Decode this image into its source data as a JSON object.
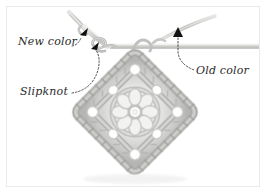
{
  "figure": {
    "kind": "instructional-photo",
    "frame_border_color": "#e9e9e9",
    "background_color": "#ffffff"
  },
  "annotations": {
    "arrow_color": "#111111",
    "leader_color": "#3a3a3a",
    "text_color": "#2b2b2b",
    "labels": [
      {
        "id": "new-color",
        "text": "New color",
        "x": 18,
        "y": 35,
        "arrow_x": 85,
        "arrow_y": 31
      },
      {
        "id": "slipknot",
        "text": "Slipknot",
        "x": 20,
        "y": 85,
        "arrow_x": 96,
        "arrow_y": 45
      },
      {
        "id": "old-color",
        "text": "Old color",
        "x": 196,
        "y": 64,
        "arrow_x": 178,
        "arrow_y": 31
      }
    ]
  },
  "photo": {
    "yarn_color_light": "#d8d8d6",
    "yarn_color_mid": "#b3b3b1",
    "yarn_color_dark": "#8d8d8b",
    "hook_color": "#cfcfcd",
    "motif": {
      "center_x": 135,
      "center_y": 112,
      "half_width": 62,
      "half_height": 62,
      "orientation": "diamond",
      "rounds": 3,
      "petal_count": 8
    },
    "hook": {
      "shaft_y": 46,
      "shaft_left_x": 110,
      "shaft_right_x": 262,
      "tip_x": 84,
      "tip_y": 27
    }
  }
}
